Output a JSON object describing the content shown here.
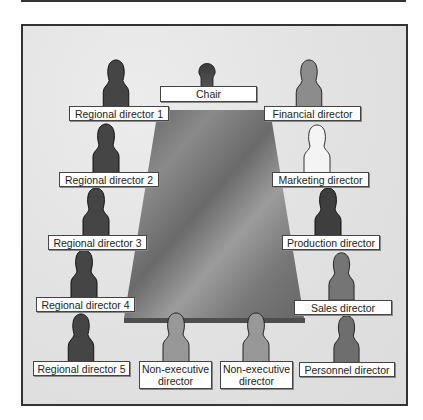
{
  "diagram": {
    "title_visible": false,
    "colors": {
      "background": "#e4e4e4",
      "frame_border": "#333333",
      "table_dark": "#6e6e6e",
      "table_light": "#a8a8a8",
      "figure_dark": "#4a4a4a",
      "figure_mid": "#7a7a7a",
      "figure_light": "#9a9a9a",
      "figure_white": "#f4f4f4"
    },
    "table": {
      "shape": "trapezoid",
      "description": "Boardroom table viewed in perspective"
    },
    "seats": [
      {
        "id": "chair",
        "label": "Chair",
        "shade": "dark"
      },
      {
        "id": "regional-director-1",
        "label": "Regional director 1",
        "shade": "dark"
      },
      {
        "id": "financial-director",
        "label": "Financial director",
        "shade": "mid"
      },
      {
        "id": "regional-director-2",
        "label": "Regional director 2",
        "shade": "dark"
      },
      {
        "id": "marketing-director",
        "label": "Marketing director",
        "shade": "white"
      },
      {
        "id": "regional-director-3",
        "label": "Regional director 3",
        "shade": "dark"
      },
      {
        "id": "production-director",
        "label": "Production director",
        "shade": "dark"
      },
      {
        "id": "regional-director-4",
        "label": "Regional director 4",
        "shade": "dark"
      },
      {
        "id": "sales-director",
        "label": "Sales director",
        "shade": "mid"
      },
      {
        "id": "regional-director-5",
        "label": "Regional director 5",
        "shade": "dark"
      },
      {
        "id": "non-executive-director-1",
        "label": "Non-executive director",
        "label_line1": "Non-executive",
        "label_line2": "director",
        "shade": "light"
      },
      {
        "id": "non-executive-director-2",
        "label": "Non-executive director",
        "label_line1": "Non-executive",
        "label_line2": "director",
        "shade": "light"
      },
      {
        "id": "personnel-director",
        "label": "Personnel director",
        "shade": "mid"
      }
    ]
  }
}
